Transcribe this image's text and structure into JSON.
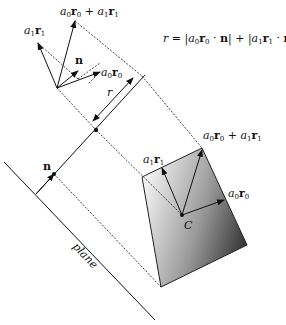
{
  "formula": {
    "r": "r",
    "eq": " = |",
    "a0": "a",
    "a0_sub": "0",
    "r0": "r",
    "r0_sub": "0",
    "dot1": " · ",
    "n1": "n",
    "mid": "| + |",
    "a1": "a",
    "a1_sub": "1",
    "r1": "r",
    "r1_sub": "1",
    "dot2": " · ",
    "n2": "n",
    "end": "|"
  },
  "labels": {
    "sum_top": {
      "a0": "a",
      "s0": "0",
      "r0": "r",
      "t0": "0",
      "plus": " + ",
      "a1": "a",
      "s1": "1",
      "r1": "r",
      "t1": "1"
    },
    "a1r1_top": {
      "a": "a",
      "s": "1",
      "r": "r",
      "t": "1"
    },
    "n_top": "n",
    "a0r0_top": {
      "a": "a",
      "s": "0",
      "r": "r",
      "t": "0"
    },
    "r_dim": "r",
    "n_axis": "n",
    "plane": "plane",
    "sum_box": {
      "a0": "a",
      "s0": "0",
      "r0": "r",
      "t0": "0",
      "plus": " + ",
      "a1": "a",
      "s1": "1",
      "r1": "r",
      "t1": "1"
    },
    "a1r1_box": {
      "a": "a",
      "s": "1",
      "r": "r",
      "t": "1"
    },
    "a0r0_box": {
      "a": "a",
      "s": "0",
      "r": "r",
      "t": "0"
    },
    "center": "C"
  },
  "colors": {
    "ink": "#111111",
    "box_light": "#f2f2f2",
    "box_dark": "#3a3a3a"
  }
}
